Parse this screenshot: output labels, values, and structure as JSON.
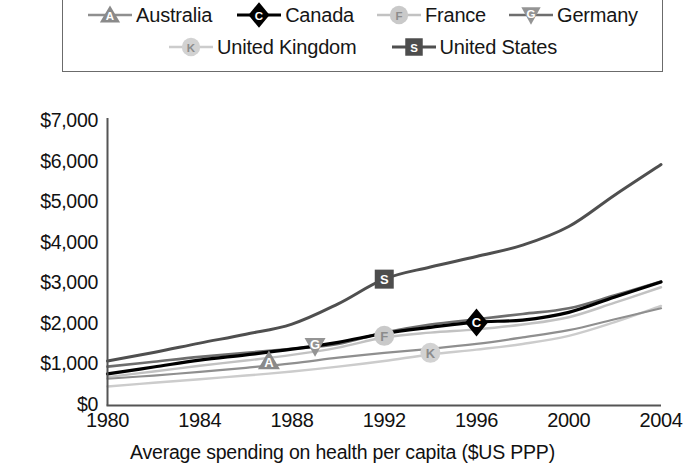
{
  "legend": {
    "entries": [
      {
        "label": "Australia",
        "key": "australia",
        "marker": "triangle-up",
        "letter": "A",
        "color": "#8a8a8a",
        "line_color": "#8f8f8f"
      },
      {
        "label": "Canada",
        "key": "canada",
        "marker": "diamond",
        "letter": "C",
        "color": "#000000",
        "line_color": "#000000"
      },
      {
        "label": "France",
        "key": "france",
        "marker": "circle",
        "letter": "F",
        "color": "#c9c9c9",
        "line_color": "#c2c2c2"
      },
      {
        "label": "Germany",
        "key": "germany",
        "marker": "triangle-down",
        "letter": "G",
        "color": "#949494",
        "line_color": "#6e6e6e"
      },
      {
        "label": "United Kingdom",
        "key": "united_kingdom",
        "marker": "circle",
        "letter": "K",
        "color": "#d2d2d2",
        "line_color": "#cccccc"
      },
      {
        "label": "United States",
        "key": "united_states",
        "marker": "square",
        "letter": "S",
        "color": "#4d4d4d",
        "line_color": "#4f4f4f"
      }
    ]
  },
  "axes": {
    "y_ticks": [
      "$7,000",
      "$6,000",
      "$5,000",
      "$4,000",
      "$3,000",
      "$2,000",
      "$1,000",
      "$0"
    ],
    "x_ticks": [
      "1980",
      "1984",
      "1988",
      "1992",
      "1996",
      "2000",
      "2004"
    ],
    "x_title": "Average spending on health per capita ($US PPP)"
  },
  "chart_data": {
    "type": "line",
    "title": "",
    "xlabel": "Average spending on health per capita ($US PPP)",
    "ylabel": "",
    "xlim": [
      1980,
      2004
    ],
    "ylim": [
      0,
      7000
    ],
    "y_ticks": [
      0,
      1000,
      2000,
      3000,
      4000,
      5000,
      6000,
      7000
    ],
    "x_ticks": [
      1980,
      1984,
      1988,
      1992,
      1996,
      2000,
      2004
    ],
    "grid": false,
    "legend_position": "top",
    "x": [
      1980,
      1982,
      1984,
      1986,
      1988,
      1990,
      1992,
      1994,
      1996,
      1998,
      2000,
      2002,
      2004
    ],
    "series": [
      {
        "name": "Australia",
        "marker_letter": "A",
        "marker_at_x": 1987,
        "marker_at_y": 1100,
        "values": [
          660,
          740,
          830,
          930,
          1040,
          1180,
          1300,
          1400,
          1520,
          1680,
          1860,
          2130,
          2400
        ]
      },
      {
        "name": "Canada",
        "marker_letter": "C",
        "marker_at_x": 1996,
        "marker_at_y": 2050,
        "values": [
          780,
          950,
          1120,
          1250,
          1390,
          1560,
          1780,
          1930,
          2060,
          2110,
          2300,
          2680,
          3050
        ]
      },
      {
        "name": "France",
        "marker_letter": "F",
        "marker_at_x": 1992,
        "marker_at_y": 1720,
        "values": [
          700,
          840,
          980,
          1110,
          1250,
          1430,
          1680,
          1800,
          1880,
          2000,
          2180,
          2540,
          2920
        ]
      },
      {
        "name": "Germany",
        "marker_letter": "G",
        "marker_at_x": 1989,
        "marker_at_y": 1460,
        "values": [
          960,
          1080,
          1200,
          1300,
          1400,
          1520,
          1800,
          2000,
          2130,
          2260,
          2400,
          2720,
          3060
        ]
      },
      {
        "name": "United Kingdom",
        "marker_letter": "K",
        "marker_at_x": 1994,
        "marker_at_y": 1300,
        "values": [
          470,
          560,
          650,
          740,
          840,
          960,
          1100,
          1260,
          1380,
          1520,
          1720,
          2060,
          2460
        ]
      },
      {
        "name": "United States",
        "marker_letter": "S",
        "marker_at_x": 1992,
        "marker_at_y": 3120,
        "values": [
          1100,
          1310,
          1540,
          1760,
          2010,
          2510,
          3120,
          3420,
          3680,
          3960,
          4420,
          5200,
          5950
        ]
      }
    ]
  }
}
